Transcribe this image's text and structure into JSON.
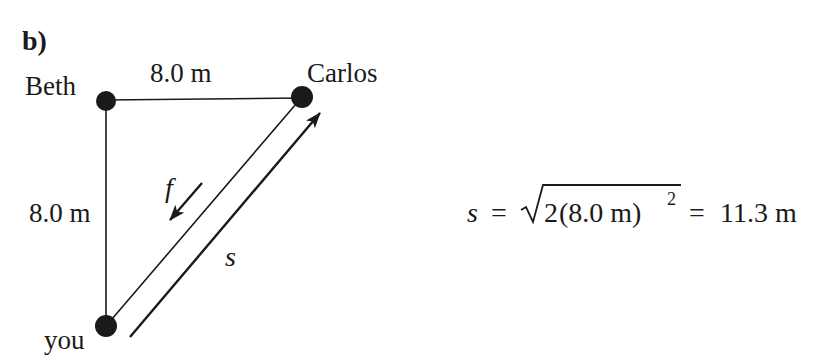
{
  "part_label": "b)",
  "nodes": {
    "beth": {
      "label": "Beth",
      "x": 106,
      "y": 101
    },
    "carlos": {
      "label": "Carlos",
      "x": 302,
      "y": 97
    },
    "you": {
      "label": "you",
      "x": 106,
      "y": 326
    }
  },
  "edges": {
    "top_length": "8.0 m",
    "left_length": "8.0 m"
  },
  "vectors": {
    "f": {
      "label": "f",
      "direction": "toward you (down-left)"
    },
    "s": {
      "label": "s",
      "direction": "toward Carlos (up-right)"
    }
  },
  "equation": {
    "lhs": "s",
    "equals1": "=",
    "radicand_coeff": "2",
    "radicand_inner": "(8.0 m)",
    "exponent": "2",
    "equals2": "=",
    "result": "11.3 m"
  },
  "colors": {
    "ink": "#1a1a1a",
    "background": "#ffffff"
  }
}
